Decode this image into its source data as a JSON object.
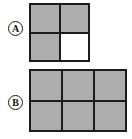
{
  "figure": {
    "background_color": "#ffffff",
    "line_color": "#1c1c1c",
    "fill_color": "#adadad",
    "empty_color": "#ffffff",
    "panels": [
      {
        "id": "A",
        "label": "A",
        "label_style": "circled-letter",
        "grid": {
          "columns": 2,
          "rows": 2,
          "total_cells": 4,
          "filled_cells": 3,
          "empty_cells": 1,
          "cells": [
            {
              "row": 1,
              "col": 1,
              "state": "filled"
            },
            {
              "row": 1,
              "col": 2,
              "state": "filled"
            },
            {
              "row": 2,
              "col": 1,
              "state": "filled"
            },
            {
              "row": 2,
              "col": 2,
              "state": "empty"
            }
          ]
        }
      },
      {
        "id": "B",
        "label": "B",
        "label_style": "circled-letter",
        "grid": {
          "columns": 3,
          "rows": 2,
          "total_cells": 6,
          "filled_cells": 6,
          "empty_cells": 0,
          "cells": [
            {
              "row": 1,
              "col": 1,
              "state": "filled"
            },
            {
              "row": 1,
              "col": 2,
              "state": "filled"
            },
            {
              "row": 1,
              "col": 3,
              "state": "filled"
            },
            {
              "row": 2,
              "col": 1,
              "state": "filled"
            },
            {
              "row": 2,
              "col": 2,
              "state": "filled"
            },
            {
              "row": 2,
              "col": 3,
              "state": "filled"
            }
          ]
        }
      }
    ]
  }
}
